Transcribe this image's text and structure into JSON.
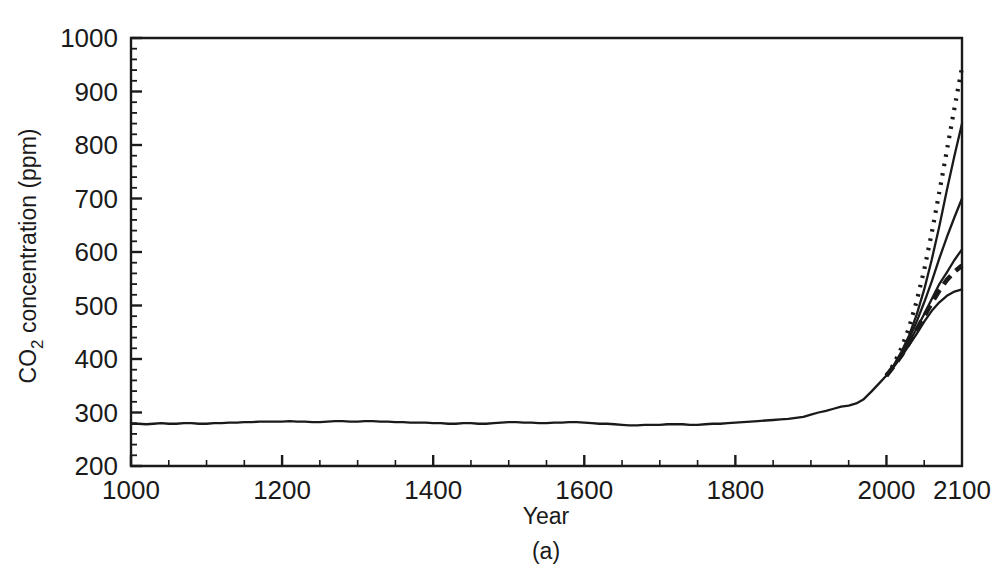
{
  "figure": {
    "panel_caption": "(a)",
    "faint_header": "",
    "background_color": "#ffffff",
    "line_color": "#1a1a1a"
  },
  "chart_data": {
    "type": "line",
    "title": "",
    "xlabel": "Year",
    "ylabel": "CO2 concentration (ppm)",
    "ylabel_parts": {
      "prefix": "CO",
      "subscript": "2",
      "suffix": " concentration (ppm)"
    },
    "xlim": [
      1000,
      2100
    ],
    "ylim": [
      200,
      1000
    ],
    "xticks": [
      1000,
      1200,
      1400,
      1600,
      1800,
      2000,
      2100
    ],
    "xticklabels": [
      "1000",
      "1200",
      "1400",
      "1600",
      "1800",
      "2000",
      "2100"
    ],
    "yticks": [
      200,
      300,
      400,
      500,
      600,
      700,
      800,
      900,
      1000
    ],
    "yticklabels": [
      "200",
      "300",
      "400",
      "500",
      "600",
      "700",
      "800",
      "900",
      "1000"
    ],
    "x_minor_tick_interval": 50,
    "y_minor_tick_interval": 20,
    "grid": false,
    "legend": "none",
    "annotations": [
      "(a)"
    ],
    "series": [
      {
        "name": "historical-record",
        "style": "solid",
        "x": [
          1000,
          1010,
          1020,
          1030,
          1040,
          1050,
          1060,
          1070,
          1080,
          1090,
          1100,
          1110,
          1120,
          1130,
          1140,
          1150,
          1160,
          1170,
          1180,
          1190,
          1200,
          1210,
          1220,
          1230,
          1240,
          1250,
          1260,
          1270,
          1280,
          1290,
          1300,
          1310,
          1320,
          1330,
          1340,
          1350,
          1360,
          1370,
          1380,
          1390,
          1400,
          1410,
          1420,
          1430,
          1440,
          1450,
          1460,
          1470,
          1480,
          1490,
          1500,
          1510,
          1520,
          1530,
          1540,
          1550,
          1560,
          1570,
          1580,
          1590,
          1600,
          1610,
          1620,
          1630,
          1640,
          1650,
          1660,
          1670,
          1680,
          1690,
          1700,
          1710,
          1720,
          1730,
          1740,
          1750,
          1760,
          1770,
          1780,
          1790,
          1800,
          1810,
          1820,
          1830,
          1840,
          1850,
          1860,
          1870,
          1880,
          1890,
          1900,
          1910,
          1920,
          1930,
          1940,
          1950,
          1960,
          1970,
          1980,
          1990,
          2000
        ],
        "y": [
          279,
          279,
          278,
          279,
          280,
          279,
          279,
          280,
          280,
          279,
          279,
          280,
          280,
          281,
          281,
          282,
          282,
          283,
          283,
          283,
          283,
          284,
          283,
          283,
          282,
          282,
          283,
          284,
          284,
          283,
          283,
          284,
          284,
          283,
          283,
          282,
          282,
          281,
          281,
          281,
          280,
          280,
          279,
          279,
          280,
          280,
          279,
          279,
          280,
          281,
          282,
          282,
          281,
          281,
          280,
          280,
          281,
          281,
          282,
          282,
          281,
          280,
          279,
          279,
          278,
          277,
          276,
          276,
          277,
          277,
          277,
          278,
          278,
          278,
          277,
          277,
          278,
          279,
          279,
          280,
          281,
          282,
          283,
          284,
          285,
          286,
          287,
          288,
          290,
          292,
          296,
          300,
          303,
          307,
          311,
          313,
          317,
          325,
          339,
          354,
          369
        ]
      },
      {
        "name": "scenario-a1fi",
        "style": "dotted",
        "x": [
          2000,
          2010,
          2020,
          2030,
          2040,
          2050,
          2060,
          2070,
          2080,
          2090,
          2100
        ],
        "y": [
          369,
          391,
          421,
          459,
          508,
          567,
          636,
          712,
          790,
          869,
          945
        ]
      },
      {
        "name": "scenario-a2",
        "style": "solid",
        "x": [
          2000,
          2010,
          2020,
          2030,
          2040,
          2050,
          2060,
          2070,
          2080,
          2090,
          2100
        ],
        "y": [
          369,
          389,
          414,
          444,
          483,
          530,
          586,
          648,
          716,
          780,
          840
        ]
      },
      {
        "name": "scenario-a1b",
        "style": "solid",
        "x": [
          2000,
          2010,
          2020,
          2030,
          2040,
          2050,
          2060,
          2070,
          2080,
          2090,
          2100
        ],
        "y": [
          369,
          388,
          411,
          438,
          470,
          506,
          545,
          588,
          628,
          665,
          700
        ]
      },
      {
        "name": "scenario-b2",
        "style": "solid",
        "x": [
          2000,
          2010,
          2020,
          2030,
          2040,
          2050,
          2060,
          2070,
          2080,
          2090,
          2100
        ],
        "y": [
          369,
          387,
          408,
          431,
          457,
          484,
          512,
          540,
          562,
          585,
          605
        ]
      },
      {
        "name": "scenario-a1t",
        "style": "dashed",
        "x": [
          2000,
          2010,
          2020,
          2030,
          2040,
          2050,
          2060,
          2070,
          2080,
          2090,
          2100
        ],
        "y": [
          369,
          387,
          407,
          430,
          455,
          480,
          505,
          528,
          548,
          563,
          575
        ]
      },
      {
        "name": "scenario-b1",
        "style": "solid",
        "x": [
          2000,
          2010,
          2020,
          2030,
          2040,
          2050,
          2060,
          2070,
          2080,
          2090,
          2100
        ],
        "y": [
          369,
          386,
          405,
          426,
          447,
          470,
          490,
          506,
          518,
          526,
          530
        ]
      }
    ]
  }
}
